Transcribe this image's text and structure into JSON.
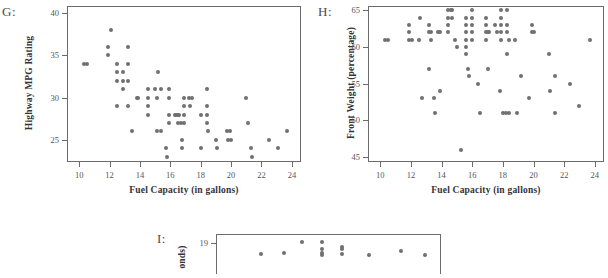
{
  "page": {
    "background": "#ffffff",
    "dot_color": "#707070",
    "axis_color": "#6b6b6b"
  },
  "panels": [
    {
      "letter": "G:",
      "chart_data": {
        "type": "scatter",
        "title": "",
        "xlabel": "Fuel Capacity (in gallons)",
        "ylabel": "Highway MPG Rating",
        "xlim": [
          9.2,
          24.6
        ],
        "ylim": [
          22.4,
          40.8
        ],
        "xticks": [
          10,
          12,
          14,
          16,
          18,
          20,
          22,
          24
        ],
        "yticks": [
          25,
          30,
          35,
          40
        ],
        "grid": false,
        "legend": "none",
        "points": [
          [
            10.3,
            34
          ],
          [
            10.5,
            34
          ],
          [
            11.9,
            36
          ],
          [
            11.9,
            35
          ],
          [
            12.1,
            38
          ],
          [
            12.5,
            34
          ],
          [
            12.5,
            33
          ],
          [
            12.5,
            32
          ],
          [
            12.5,
            29
          ],
          [
            12.9,
            33
          ],
          [
            12.9,
            32
          ],
          [
            12.9,
            31
          ],
          [
            13.2,
            36
          ],
          [
            13.2,
            34
          ],
          [
            13.2,
            32
          ],
          [
            13.2,
            29
          ],
          [
            13.5,
            26
          ],
          [
            13.8,
            30
          ],
          [
            13.9,
            30
          ],
          [
            14.5,
            31
          ],
          [
            14.5,
            30
          ],
          [
            14.5,
            29
          ],
          [
            14.5,
            28
          ],
          [
            15.0,
            31
          ],
          [
            15.1,
            30
          ],
          [
            15.1,
            26
          ],
          [
            15.2,
            33
          ],
          [
            15.4,
            31
          ],
          [
            15.4,
            26
          ],
          [
            15.7,
            24
          ],
          [
            15.8,
            23
          ],
          [
            15.9,
            31
          ],
          [
            15.9,
            30
          ],
          [
            15.9,
            28
          ],
          [
            15.9,
            27
          ],
          [
            16.3,
            28
          ],
          [
            16.4,
            28
          ],
          [
            16.5,
            28
          ],
          [
            16.5,
            27
          ],
          [
            16.6,
            28
          ],
          [
            16.7,
            27
          ],
          [
            16.8,
            25
          ],
          [
            16.8,
            24
          ],
          [
            16.9,
            30
          ],
          [
            16.9,
            29
          ],
          [
            16.9,
            28
          ],
          [
            16.9,
            27
          ],
          [
            17.2,
            30
          ],
          [
            17.3,
            29
          ],
          [
            17.4,
            30
          ],
          [
            18.0,
            28
          ],
          [
            18.0,
            24
          ],
          [
            18.4,
            31
          ],
          [
            18.4,
            29
          ],
          [
            18.4,
            28
          ],
          [
            18.4,
            27
          ],
          [
            18.5,
            26
          ],
          [
            19.0,
            25
          ],
          [
            19.1,
            24
          ],
          [
            19.7,
            26
          ],
          [
            19.8,
            25
          ],
          [
            19.9,
            26
          ],
          [
            20.0,
            25
          ],
          [
            21.0,
            30
          ],
          [
            21.1,
            27
          ],
          [
            21.3,
            24
          ],
          [
            21.4,
            23
          ],
          [
            22.5,
            25
          ],
          [
            23.1,
            24
          ],
          [
            23.7,
            26
          ]
        ]
      }
    },
    {
      "letter": "H:",
      "chart_data": {
        "type": "scatter",
        "title": "",
        "xlabel": "Fuel Capacity (in gallons)",
        "ylabel": "Front Weight (percentage)",
        "xlim": [
          9.2,
          24.6
        ],
        "ylim": [
          44.3,
          65.6
        ],
        "xticks": [
          10,
          12,
          14,
          16,
          18,
          20,
          22,
          24
        ],
        "yticks": [
          45,
          50,
          55,
          60,
          65
        ],
        "grid": false,
        "legend": "none",
        "points": [
          [
            10.3,
            61
          ],
          [
            10.5,
            61
          ],
          [
            11.9,
            63
          ],
          [
            11.9,
            62
          ],
          [
            11.9,
            61
          ],
          [
            12.1,
            61
          ],
          [
            12.5,
            61
          ],
          [
            12.6,
            64
          ],
          [
            12.7,
            53
          ],
          [
            13.2,
            63
          ],
          [
            13.2,
            62
          ],
          [
            13.3,
            62
          ],
          [
            13.3,
            61
          ],
          [
            13.2,
            57
          ],
          [
            13.5,
            53
          ],
          [
            13.6,
            51
          ],
          [
            13.8,
            62
          ],
          [
            13.9,
            62
          ],
          [
            13.9,
            54
          ],
          [
            14.4,
            65
          ],
          [
            14.4,
            64
          ],
          [
            14.4,
            63
          ],
          [
            14.4,
            62
          ],
          [
            14.6,
            65
          ],
          [
            14.7,
            65
          ],
          [
            14.7,
            64
          ],
          [
            14.9,
            61
          ],
          [
            15.0,
            60
          ],
          [
            15.3,
            46
          ],
          [
            15.6,
            64
          ],
          [
            15.6,
            63
          ],
          [
            15.6,
            62
          ],
          [
            15.6,
            61
          ],
          [
            15.6,
            60
          ],
          [
            15.6,
            59
          ],
          [
            15.7,
            57
          ],
          [
            15.8,
            56
          ],
          [
            16.0,
            65
          ],
          [
            16.0,
            64
          ],
          [
            16.0,
            63
          ],
          [
            16.0,
            62
          ],
          [
            16.0,
            61
          ],
          [
            16.4,
            55
          ],
          [
            16.5,
            51
          ],
          [
            16.9,
            64
          ],
          [
            16.9,
            63
          ],
          [
            16.9,
            62
          ],
          [
            17.0,
            62
          ],
          [
            17.1,
            62
          ],
          [
            16.9,
            61
          ],
          [
            17.0,
            57
          ],
          [
            17.5,
            63
          ],
          [
            17.6,
            62
          ],
          [
            17.9,
            65
          ],
          [
            17.9,
            64
          ],
          [
            17.9,
            63
          ],
          [
            17.9,
            62
          ],
          [
            17.9,
            61
          ],
          [
            17.8,
            54
          ],
          [
            18.0,
            51
          ],
          [
            18.2,
            51
          ],
          [
            18.4,
            51
          ],
          [
            18.3,
            65
          ],
          [
            18.3,
            63
          ],
          [
            18.3,
            62
          ],
          [
            18.4,
            61
          ],
          [
            18.3,
            59
          ],
          [
            18.8,
            61
          ],
          [
            18.9,
            51
          ],
          [
            19.2,
            56
          ],
          [
            19.7,
            53
          ],
          [
            19.9,
            63
          ],
          [
            19.9,
            62
          ],
          [
            20.0,
            62
          ],
          [
            21.0,
            59
          ],
          [
            21.1,
            54
          ],
          [
            21.4,
            56
          ],
          [
            21.4,
            51
          ],
          [
            22.4,
            55
          ],
          [
            23.0,
            52
          ],
          [
            23.7,
            61
          ]
        ]
      }
    },
    {
      "letter": "I:",
      "chart_data": {
        "type": "scatter",
        "title": "",
        "xlabel": "",
        "ylabel": "onds)",
        "xlim": [
          0,
          100
        ],
        "ylim": [
          17.6,
          19.4
        ],
        "xticks": [],
        "yticks": [
          19
        ],
        "grid": false,
        "legend": "none",
        "points": [
          [
            38,
            19.05
          ],
          [
            47,
            19.05
          ],
          [
            47,
            18.72
          ],
          [
            47,
            18.55
          ],
          [
            47,
            18.45
          ],
          [
            56,
            18.8
          ],
          [
            56,
            18.72
          ],
          [
            56,
            18.5
          ],
          [
            20,
            18.5
          ],
          [
            30,
            18.55
          ],
          [
            68,
            18.45
          ],
          [
            82,
            18.62
          ],
          [
            93,
            18.45
          ]
        ]
      }
    }
  ]
}
